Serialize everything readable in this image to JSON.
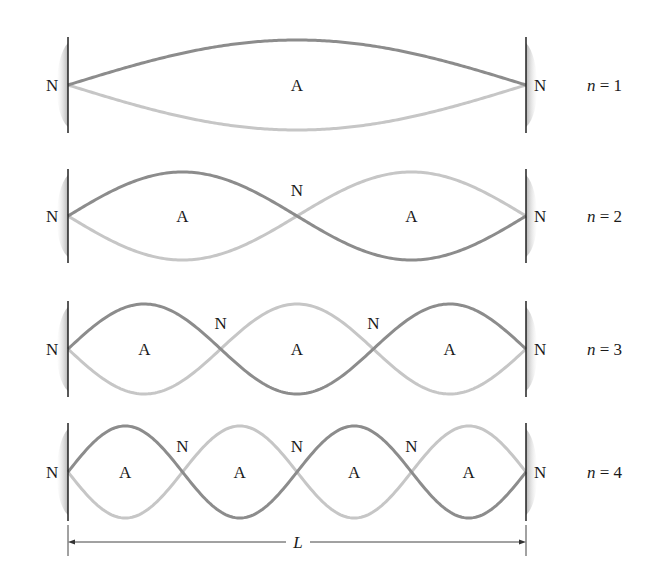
{
  "diagram": {
    "title": "Standing wave modes on a string fixed at both ends",
    "node_label": "N",
    "antinode_label": "A",
    "length_label": "L",
    "colors": {
      "wave_dark": "#8c8c8c",
      "wave_light": "#c6c6c6",
      "wall": "#222222",
      "wall_shade": "#bdbdbd",
      "text": "#1a1a1a"
    },
    "geometry": {
      "wall_left_x": 68,
      "wall_right_x": 526
    },
    "modes": [
      {
        "n": 1,
        "label": "n = 1",
        "center_y": 85,
        "amplitude": 45
      },
      {
        "n": 2,
        "label": "n = 2",
        "center_y": 216,
        "amplitude": 44
      },
      {
        "n": 3,
        "label": "n = 3",
        "center_y": 349,
        "amplitude": 45
      },
      {
        "n": 4,
        "label": "n = 4",
        "center_y": 472,
        "amplitude": 46
      }
    ],
    "dimension": {
      "y": 542,
      "label": "L"
    }
  }
}
